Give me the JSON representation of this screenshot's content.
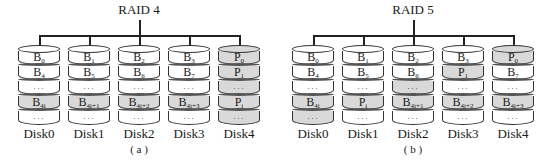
{
  "panels": [
    {
      "id": "a",
      "title": "RAID 4",
      "caption": "( a )",
      "disks": [
        {
          "label": "Disk0",
          "cells": [
            {
              "text": "B",
              "sub": "0",
              "shaded": false
            },
            {
              "text": "B",
              "sub": "4",
              "shaded": false
            },
            {
              "text": "…",
              "sub": "",
              "shaded": false
            },
            {
              "text": "B",
              "sub": "4i",
              "shaded": true
            },
            {
              "text": "…",
              "sub": "",
              "shaded": false
            }
          ]
        },
        {
          "label": "Disk1",
          "cells": [
            {
              "text": "B",
              "sub": "1",
              "shaded": false
            },
            {
              "text": "B",
              "sub": "5",
              "shaded": false
            },
            {
              "text": "…",
              "sub": "",
              "shaded": false
            },
            {
              "text": "B",
              "sub": "4i+1",
              "shaded": true
            },
            {
              "text": "…",
              "sub": "",
              "shaded": false
            }
          ]
        },
        {
          "label": "Disk2",
          "cells": [
            {
              "text": "B",
              "sub": "2",
              "shaded": false
            },
            {
              "text": "B",
              "sub": "6",
              "shaded": false
            },
            {
              "text": "…",
              "sub": "",
              "shaded": false
            },
            {
              "text": "B",
              "sub": "4i+2",
              "shaded": true
            },
            {
              "text": "…",
              "sub": "",
              "shaded": false
            }
          ]
        },
        {
          "label": "Disk3",
          "cells": [
            {
              "text": "B",
              "sub": "3",
              "shaded": false
            },
            {
              "text": "B",
              "sub": "7",
              "shaded": false
            },
            {
              "text": "…",
              "sub": "",
              "shaded": false
            },
            {
              "text": "B",
              "sub": "4i+3",
              "shaded": true
            },
            {
              "text": "…",
              "sub": "",
              "shaded": false
            }
          ]
        },
        {
          "label": "Disk4",
          "cells": [
            {
              "text": "P",
              "sub": "0",
              "shaded": true
            },
            {
              "text": "P",
              "sub": "1",
              "shaded": true
            },
            {
              "text": "…",
              "sub": "",
              "shaded": true
            },
            {
              "text": "P",
              "sub": "i",
              "shaded": true
            },
            {
              "text": "…",
              "sub": "",
              "shaded": true
            }
          ]
        }
      ]
    },
    {
      "id": "b",
      "title": "RAID 5",
      "caption": "( b )",
      "disks": [
        {
          "label": "Disk0",
          "cells": [
            {
              "text": "B",
              "sub": "0",
              "shaded": false
            },
            {
              "text": "B",
              "sub": "4",
              "shaded": false
            },
            {
              "text": "…",
              "sub": "",
              "shaded": false
            },
            {
              "text": "B",
              "sub": "4i",
              "shaded": true
            },
            {
              "text": "…",
              "sub": "",
              "shaded": true
            }
          ]
        },
        {
          "label": "Disk1",
          "cells": [
            {
              "text": "B",
              "sub": "1",
              "shaded": false
            },
            {
              "text": "B",
              "sub": "5",
              "shaded": false
            },
            {
              "text": "…",
              "sub": "",
              "shaded": false
            },
            {
              "text": "P",
              "sub": "i",
              "shaded": true
            },
            {
              "text": "…",
              "sub": "",
              "shaded": false
            }
          ]
        },
        {
          "label": "Disk2",
          "cells": [
            {
              "text": "B",
              "sub": "2",
              "shaded": false
            },
            {
              "text": "B",
              "sub": "6",
              "shaded": false
            },
            {
              "text": "…",
              "sub": "",
              "shaded": true
            },
            {
              "text": "B",
              "sub": "4i+1",
              "shaded": true
            },
            {
              "text": "…",
              "sub": "",
              "shaded": false
            }
          ]
        },
        {
          "label": "Disk3",
          "cells": [
            {
              "text": "B",
              "sub": "3",
              "shaded": false
            },
            {
              "text": "P",
              "sub": "1",
              "shaded": true
            },
            {
              "text": "…",
              "sub": "",
              "shaded": false
            },
            {
              "text": "B",
              "sub": "4i+2",
              "shaded": true
            },
            {
              "text": "…",
              "sub": "",
              "shaded": false
            }
          ]
        },
        {
          "label": "Disk4",
          "cells": [
            {
              "text": "P",
              "sub": "0",
              "shaded": true
            },
            {
              "text": "B",
              "sub": "7",
              "shaded": false
            },
            {
              "text": "…",
              "sub": "",
              "shaded": false
            },
            {
              "text": "B",
              "sub": "4i+3",
              "shaded": true
            },
            {
              "text": "…",
              "sub": "",
              "shaded": false
            }
          ]
        }
      ]
    }
  ]
}
